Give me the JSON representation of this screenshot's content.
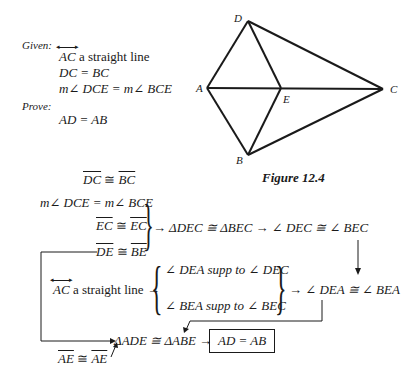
{
  "given": {
    "heading": "Given:",
    "lines": [
      {
        "ray": "AC",
        "text": " a straight line"
      },
      {
        "text": "DC = BC"
      },
      {
        "text": "m∠ DCE = m∠ BCE"
      }
    ]
  },
  "prove": {
    "heading": "Prove:",
    "statement": "AD = AB"
  },
  "figure": {
    "caption": "Figure 12.4",
    "points": {
      "A": {
        "label": "A",
        "x": 207,
        "y": 88
      },
      "B": {
        "label": "B",
        "x": 248,
        "y": 155
      },
      "C": {
        "label": "C",
        "x": 383,
        "y": 89
      },
      "D": {
        "label": "D",
        "x": 248,
        "y": 21
      },
      "E": {
        "label": "E",
        "x": 281,
        "y": 88
      }
    },
    "segments": [
      "AD",
      "DC",
      "AC",
      "DE",
      "AB",
      "BE",
      "BC"
    ]
  },
  "flow": {
    "s1": {
      "a": "DC",
      "rel": " ≅ ",
      "b": "BC"
    },
    "s2": "m∠ DCE = m∠ BCE",
    "s3": {
      "a": "EC",
      "rel": " ≅ ",
      "b": "EC"
    },
    "s4": {
      "a": "DE",
      "rel": " ≅ ",
      "b": "BE"
    },
    "c1": "→ ΔDEC ≅ ΔBEC → ∠ DEC ≅ ∠ BEC",
    "s5": {
      "ray": "AC",
      "text": " a straight line →"
    },
    "supp1": "∠ DEA supp to ∠ DEC",
    "supp2": "∠ BEA supp to ∠ BEC",
    "c2": "→ ∠ DEA ≅ ∠ BEA",
    "c3": "ΔADE ≅ ΔABE →",
    "result": "AD = AB",
    "s6": {
      "a": "AE",
      "rel": " ≅ ",
      "b": "AE"
    }
  }
}
